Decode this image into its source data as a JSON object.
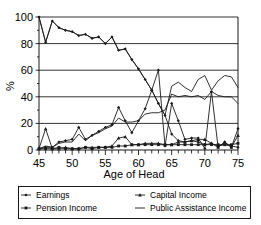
{
  "chart_data": {
    "type": "line",
    "title": "",
    "xlabel": "Age of Head",
    "ylabel": "%",
    "xlim": [
      45,
      75
    ],
    "ylim": [
      0,
      100
    ],
    "xticks": [
      45,
      50,
      55,
      60,
      65,
      70,
      75
    ],
    "xtick_labels": [
      "45",
      "50",
      "55",
      "60",
      "65",
      "70",
      "75"
    ],
    "xminor_step": 1,
    "yticks": [
      0,
      20,
      40,
      60,
      80,
      100
    ],
    "ytick_labels": [
      "0",
      "20",
      "40",
      "60",
      "80",
      "100"
    ],
    "grid": "horizontal",
    "legend_position": "below-plot",
    "x": [
      45,
      46,
      47,
      48,
      49,
      50,
      51,
      52,
      53,
      54,
      55,
      56,
      57,
      58,
      59,
      60,
      61,
      62,
      63,
      64,
      65,
      66,
      67,
      68,
      69,
      70,
      71,
      72,
      73,
      74,
      75
    ],
    "series": [
      {
        "name": "Earnings",
        "marker": "diamond",
        "values": [
          100,
          81,
          97,
          92,
          90,
          89,
          86,
          87,
          84,
          85,
          80,
          85,
          75,
          76,
          68,
          61,
          53,
          45,
          35,
          26,
          12,
          7,
          6,
          7,
          6,
          4,
          5,
          3,
          4,
          3,
          2
        ]
      },
      {
        "name": "Pension Income",
        "marker": "square",
        "values": [
          1,
          1,
          1,
          2,
          1,
          1,
          1,
          2,
          1,
          2,
          2,
          2,
          3,
          3,
          4,
          4,
          4,
          4,
          4,
          4,
          4,
          4,
          4,
          4,
          4,
          4,
          4,
          4,
          4,
          4,
          5
        ]
      },
      {
        "name": "Capital Income",
        "marker": "triangle",
        "values": [
          1,
          16,
          1,
          1,
          2,
          1,
          1,
          2,
          2,
          2,
          2,
          3,
          9,
          10,
          4,
          4,
          5,
          5,
          5,
          4,
          4,
          6,
          6,
          7,
          8,
          8,
          5,
          2,
          6,
          2,
          11
        ]
      },
      {
        "name": "Public Assistance Income",
        "marker": "none",
        "values": [
          1,
          3,
          2,
          5,
          6,
          6,
          12,
          7,
          11,
          13,
          16,
          18,
          24,
          21,
          21,
          22,
          27,
          28,
          28,
          30,
          42,
          40,
          41,
          40,
          41,
          38,
          44,
          41,
          40,
          40,
          35
        ]
      },
      {
        "name": "Earnings-secondary",
        "marker": "diamond",
        "values": [
          1,
          2,
          2,
          6,
          7,
          8,
          17,
          8,
          11,
          14,
          17,
          19,
          32,
          22,
          13,
          22,
          31,
          45,
          60,
          3,
          35,
          22,
          8,
          9,
          9,
          1,
          44,
          2,
          6,
          2,
          16
        ]
      },
      {
        "name": "Public-Assistance-upper",
        "marker": "none",
        "values": [
          100,
          81,
          97,
          92,
          90,
          89,
          86,
          87,
          84,
          85,
          80,
          85,
          75,
          76,
          68,
          61,
          53,
          45,
          35,
          26,
          48,
          51,
          47,
          44,
          53,
          56,
          45,
          52,
          56,
          55,
          47
        ]
      }
    ]
  },
  "legend": {
    "items": [
      {
        "label": "Earnings",
        "marker": "diamond"
      },
      {
        "label": "Capital Income",
        "marker": "triangle"
      },
      {
        "label": "Pension Income",
        "marker": "square"
      },
      {
        "label": "Public Assistance Income",
        "marker": "line"
      }
    ]
  },
  "axes": {
    "x_title": "Age of Head",
    "y_title": "%"
  }
}
